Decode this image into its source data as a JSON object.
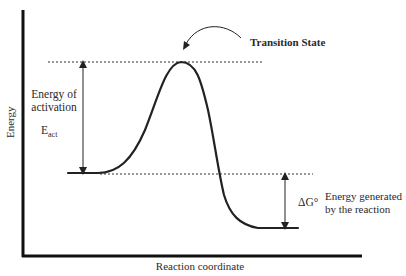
{
  "diagram": {
    "type": "energy_profile",
    "axes": {
      "y_label": "Energy",
      "x_label": "Reaction coordinate"
    },
    "annotations": {
      "transition_state": "Transition State",
      "activation_line1": "Energy of",
      "activation_line2": "activation",
      "eact_main": "E",
      "eact_sub": "act",
      "delta_g": "ΔG°",
      "generated_line1": "Energy generated",
      "generated_line2": "by the reaction"
    },
    "levels": {
      "reactants": "high",
      "transition_state": "peak",
      "products": "low"
    },
    "colors": {
      "line": "#222222",
      "background": "#ffffff"
    }
  }
}
